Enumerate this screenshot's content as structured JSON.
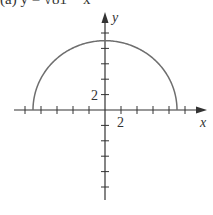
{
  "title": "(a) y = √81 − x²",
  "chart_data": {
    "type": "line",
    "xlabel": "x",
    "ylabel": "y",
    "tick_labels": {
      "x": [
        "2"
      ],
      "y": [
        "2"
      ]
    },
    "tick_step": 1,
    "xlim": [
      -11,
      11
    ],
    "ylim": [
      -11,
      12
    ],
    "grid": false,
    "legend": null,
    "series": [
      {
        "name": "y = sqrt(81 - x^2)",
        "x": [
          -9,
          -8,
          -6,
          -4,
          -2,
          0,
          2,
          4,
          6,
          8,
          9
        ],
        "y": [
          0,
          4.12,
          6.71,
          8.06,
          8.78,
          9,
          8.78,
          8.06,
          6.71,
          4.12,
          0
        ]
      }
    ],
    "colors": {
      "curve": "#6e6e6e",
      "axes": "#333333"
    }
  }
}
